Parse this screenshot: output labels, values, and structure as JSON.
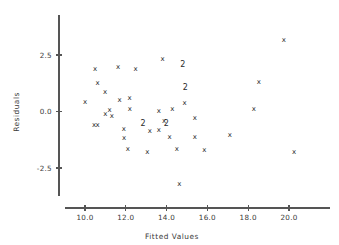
{
  "chart_data": {
    "type": "scatter",
    "title": "",
    "xlabel": "Fitted Values",
    "ylabel": "Residuals",
    "xlim": [
      9.0,
      21.4
    ],
    "ylim": [
      -4.1,
      3.6
    ],
    "grid": false,
    "legend": null,
    "xticks": [
      10.0,
      12.0,
      14.0,
      16.0,
      18.0,
      20.0
    ],
    "xticklabels": [
      "10.0",
      "12.0",
      "14.0",
      "16.0",
      "18.0",
      "20.0"
    ],
    "yticks": [
      2.5,
      0.0,
      -2.5
    ],
    "yticklabels": [
      "2.5",
      "0.0",
      "-2.5"
    ],
    "marker_symbol": "x",
    "overlap_symbol": "2",
    "overlap_note": "A '2' glyph marks a location where two observations coincide",
    "points": [
      {
        "x": 10.0,
        "y": 0.42,
        "label": "x",
        "count": 1
      },
      {
        "x": 10.45,
        "y": -0.6,
        "label": "x",
        "count": 1
      },
      {
        "x": 10.62,
        "y": -0.6,
        "label": "x",
        "count": 1
      },
      {
        "x": 10.5,
        "y": 1.9,
        "label": "x",
        "count": 1
      },
      {
        "x": 10.62,
        "y": 1.27,
        "label": "x",
        "count": 1
      },
      {
        "x": 10.98,
        "y": 0.86,
        "label": "x",
        "count": 1
      },
      {
        "x": 11.0,
        "y": -0.12,
        "label": "x",
        "count": 1
      },
      {
        "x": 11.2,
        "y": 0.05,
        "label": "x",
        "count": 1
      },
      {
        "x": 11.32,
        "y": -0.18,
        "label": "x",
        "count": 1
      },
      {
        "x": 11.62,
        "y": 1.98,
        "label": "x",
        "count": 1
      },
      {
        "x": 11.7,
        "y": 0.52,
        "label": "x",
        "count": 1
      },
      {
        "x": 11.9,
        "y": -0.78,
        "label": "x",
        "count": 1
      },
      {
        "x": 11.92,
        "y": -1.18,
        "label": "x",
        "count": 1
      },
      {
        "x": 12.18,
        "y": 0.58,
        "label": "x",
        "count": 1
      },
      {
        "x": 12.2,
        "y": 0.1,
        "label": "x",
        "count": 1
      },
      {
        "x": 12.1,
        "y": -1.68,
        "label": "x",
        "count": 1
      },
      {
        "x": 12.48,
        "y": 1.86,
        "label": "x",
        "count": 1
      },
      {
        "x": 12.85,
        "y": -0.52,
        "label": "2",
        "count": 2
      },
      {
        "x": 13.05,
        "y": -1.78,
        "label": "x",
        "count": 1
      },
      {
        "x": 13.18,
        "y": -0.88,
        "label": "x",
        "count": 1
      },
      {
        "x": 13.62,
        "y": 0.02,
        "label": "x",
        "count": 1
      },
      {
        "x": 13.62,
        "y": -0.82,
        "label": "x",
        "count": 1
      },
      {
        "x": 13.8,
        "y": 2.32,
        "label": "x",
        "count": 1
      },
      {
        "x": 13.88,
        "y": -0.42,
        "label": "x",
        "count": 1
      },
      {
        "x": 13.98,
        "y": -0.55,
        "label": "2",
        "count": 2
      },
      {
        "x": 14.15,
        "y": -1.12,
        "label": "x",
        "count": 1
      },
      {
        "x": 14.28,
        "y": 0.12,
        "label": "x",
        "count": 1
      },
      {
        "x": 14.5,
        "y": -1.68,
        "label": "x",
        "count": 1
      },
      {
        "x": 14.62,
        "y": -3.2,
        "label": "x",
        "count": 1
      },
      {
        "x": 14.8,
        "y": 2.08,
        "label": "2",
        "count": 2
      },
      {
        "x": 14.88,
        "y": 0.38,
        "label": "x",
        "count": 1
      },
      {
        "x": 14.92,
        "y": 1.05,
        "label": "2",
        "count": 2
      },
      {
        "x": 15.38,
        "y": -0.28,
        "label": "x",
        "count": 1
      },
      {
        "x": 15.38,
        "y": -1.15,
        "label": "x",
        "count": 1
      },
      {
        "x": 15.85,
        "y": -1.7,
        "label": "x",
        "count": 1
      },
      {
        "x": 17.1,
        "y": -1.02,
        "label": "x",
        "count": 1
      },
      {
        "x": 18.28,
        "y": 0.12,
        "label": "x",
        "count": 1
      },
      {
        "x": 18.52,
        "y": 1.32,
        "label": "x",
        "count": 1
      },
      {
        "x": 19.75,
        "y": 3.15,
        "label": "x",
        "count": 1
      },
      {
        "x": 20.25,
        "y": -1.78,
        "label": "x",
        "count": 1
      }
    ]
  }
}
